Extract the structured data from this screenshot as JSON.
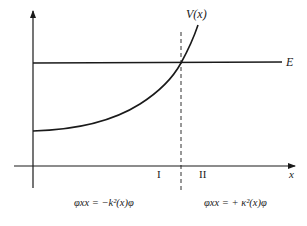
{
  "diagram": {
    "labels": {
      "potential": "V(x)",
      "energy": "E",
      "x_axis": "x",
      "region_1": "I",
      "region_2": "II"
    },
    "equations": {
      "region_1": "φxx = −k²(x)φ",
      "region_2": "φxx = + κ²(x)φ"
    },
    "colors": {
      "ink": "#1a1a1a",
      "background": "#ffffff"
    }
  }
}
